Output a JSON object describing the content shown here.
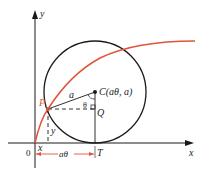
{
  "diagram": {
    "type": "cycloid-construction",
    "colors": {
      "curve": "#e0553a",
      "ink": "#1a1a1a",
      "background": "#ffffff"
    },
    "axes": {
      "x_label": "x",
      "y_label": "y",
      "origin_label": "0"
    },
    "points": {
      "P": "P",
      "C": "C(aθ, a)",
      "Q": "Q",
      "T": "T"
    },
    "labels": {
      "radius": "a",
      "angle": "θ",
      "x_coord": "x",
      "y_coord": "y",
      "arc_length": "aθ"
    }
  }
}
